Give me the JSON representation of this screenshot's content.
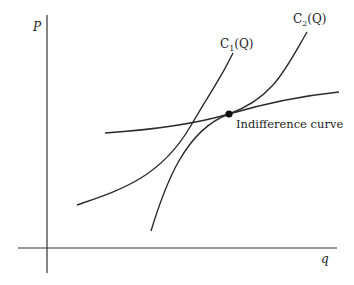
{
  "diagram": {
    "axes": {
      "y_label": "P",
      "x_label": "q"
    },
    "curves": [
      {
        "id": "c1",
        "label_main": "C",
        "label_sub": "1",
        "label_arg": "(Q)"
      },
      {
        "id": "c2",
        "label_main": "C",
        "label_sub": "2",
        "label_arg": "(Q)"
      },
      {
        "id": "indifference",
        "label": "Indifference curve"
      }
    ],
    "point": {
      "name": "tangency-point"
    },
    "colors": {
      "stroke": "#2a2a2a",
      "background": "#ffffff"
    }
  }
}
